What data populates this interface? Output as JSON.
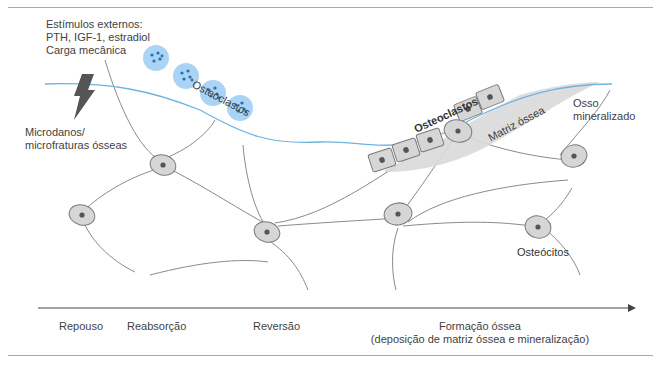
{
  "figure": {
    "stimuli": {
      "line1": "Estímulos externos:",
      "line2": "PTH, IGF-1, estradiol",
      "line3": "Carga mecânica"
    },
    "microdamage": {
      "line1": "Microdanos/",
      "line2": "microfraturas ósseas"
    },
    "labels": {
      "osteoclasts": "Osteoclastos",
      "osteoblasts": "Osteoclastos",
      "matrix": "Matriz óssea",
      "mineralized_line1": "Osso",
      "mineralized_line2": "mineralizado",
      "osteocytes": "Osteócitos"
    },
    "timeline": {
      "phases": [
        {
          "label": "Repouso"
        },
        {
          "label": "Reabsorção"
        },
        {
          "label": "Reversão"
        },
        {
          "label": "Formação óssea",
          "sublabel": "(deposição de matriz óssea e mineralização)"
        }
      ]
    },
    "colors": {
      "surface_line": "#6fb3e0",
      "osteoclast_fill": "#a9d4f5",
      "osteoclast_nuclei": "#2f6fa3",
      "cell_fill": "#d6d6d6",
      "cell_stroke": "#7a7a7a",
      "matrix_fill": "#d9d9d9",
      "rule": "#7fb6d8"
    }
  }
}
